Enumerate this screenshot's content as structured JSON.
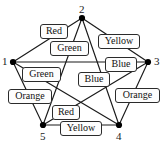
{
  "figure": {
    "name": "graph-coloring-diagram",
    "vertices": [
      {
        "id": "v1",
        "label": "1",
        "x": 13,
        "y": 62,
        "label_x": 2,
        "label_y": 56
      },
      {
        "id": "v2",
        "label": "2",
        "x": 82,
        "y": 18,
        "label_x": 79,
        "label_y": 4
      },
      {
        "id": "v3",
        "label": "3",
        "x": 148,
        "y": 62,
        "label_x": 154,
        "label_y": 56
      },
      {
        "id": "v4",
        "label": "4",
        "x": 119,
        "y": 125,
        "label_x": 116,
        "label_y": 131
      },
      {
        "id": "v5",
        "label": "5",
        "x": 43,
        "y": 125,
        "label_x": 40,
        "label_y": 131
      }
    ],
    "edges": [
      {
        "from": "v1",
        "to": "v2",
        "color_label": "Red"
      },
      {
        "from": "v2",
        "to": "v3",
        "color_label": "Yellow"
      },
      {
        "from": "v1",
        "to": "v3",
        "color_label": "Blue"
      },
      {
        "from": "v2",
        "to": "v5",
        "color_label": "Green"
      },
      {
        "from": "v2",
        "to": "v4",
        "color_label": "Blue"
      },
      {
        "from": "v1",
        "to": "v4",
        "color_label": "Green"
      },
      {
        "from": "v1",
        "to": "v5",
        "color_label": "Orange"
      },
      {
        "from": "v3",
        "to": "v4",
        "color_label": "Orange"
      },
      {
        "from": "v3",
        "to": "v5",
        "color_label": "Red"
      },
      {
        "from": "v4",
        "to": "v5",
        "color_label": "Yellow"
      }
    ],
    "edge_labels": [
      {
        "name": "edge-label-red-1-2",
        "text": "Red",
        "x": 40,
        "y": 24,
        "w": 28
      },
      {
        "name": "edge-label-green-2-5",
        "text": "Green",
        "x": 50,
        "y": 41,
        "w": 39
      },
      {
        "name": "edge-label-yellow-2-3",
        "text": "Yellow",
        "x": 98,
        "y": 34,
        "w": 42
      },
      {
        "name": "edge-label-blue-1-3",
        "text": "Blue",
        "x": 105,
        "y": 57,
        "w": 32
      },
      {
        "name": "edge-label-green-1-4",
        "text": "Green",
        "x": 22,
        "y": 67,
        "w": 39
      },
      {
        "name": "edge-label-blue-2-4",
        "text": "Blue",
        "x": 78,
        "y": 72,
        "w": 32
      },
      {
        "name": "edge-label-orange-1-5",
        "text": "Orange",
        "x": 8,
        "y": 89,
        "w": 44
      },
      {
        "name": "edge-label-orange-3-4",
        "text": "Orange",
        "x": 115,
        "y": 88,
        "w": 45
      },
      {
        "name": "edge-label-red-3-5",
        "text": "Red",
        "x": 52,
        "y": 105,
        "w": 28
      },
      {
        "name": "edge-label-yellow-4-5",
        "text": "Yellow",
        "x": 60,
        "y": 121,
        "w": 42
      }
    ],
    "partial_caption": "",
    "accent_colors": {
      "stroke": "#1a1a1a",
      "vertex": "#000000",
      "label_box_fill": "#fdfdfd",
      "label_box_border": "#2b2b2b"
    }
  },
  "chart_data": {
    "type": "diagram",
    "title": "",
    "nodes": [
      "1",
      "2",
      "3",
      "4",
      "5"
    ],
    "edges": [
      {
        "u": "1",
        "v": "2",
        "label": "Red"
      },
      {
        "u": "2",
        "v": "3",
        "label": "Yellow"
      },
      {
        "u": "1",
        "v": "3",
        "label": "Blue"
      },
      {
        "u": "2",
        "v": "5",
        "label": "Green"
      },
      {
        "u": "2",
        "v": "4",
        "label": "Blue"
      },
      {
        "u": "1",
        "v": "4",
        "label": "Green"
      },
      {
        "u": "1",
        "v": "5",
        "label": "Orange"
      },
      {
        "u": "3",
        "v": "4",
        "label": "Orange"
      },
      {
        "u": "3",
        "v": "5",
        "label": "Red"
      },
      {
        "u": "4",
        "v": "5",
        "label": "Yellow"
      }
    ]
  }
}
